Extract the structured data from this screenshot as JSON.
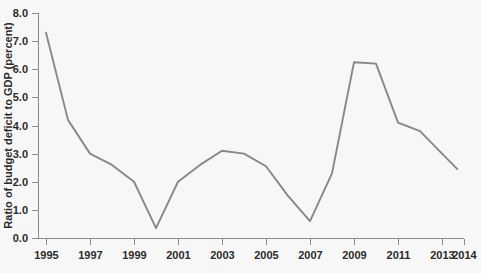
{
  "chart_data": {
    "type": "line",
    "title": "",
    "subtitle": "",
    "xlabel": "",
    "ylabel": "Ratio of budget deficit to GDP (percent)",
    "xlim": [
      1995,
      2014
    ],
    "ylim": [
      0.0,
      8.0
    ],
    "grid": false,
    "legend": null,
    "legend_position": "none",
    "x_tick_labels": [
      "1995",
      "1997",
      "1999",
      "2001",
      "2003",
      "2005",
      "2007",
      "2009",
      "2011",
      "2013",
      "2014"
    ],
    "x_tick_values": [
      1995,
      1997,
      1999,
      2001,
      2003,
      2005,
      2007,
      2009,
      2011,
      2013,
      2014
    ],
    "y_tick_labels": [
      "0.0",
      "1.0",
      "2.0",
      "3.0",
      "4.0",
      "5.0",
      "6.0",
      "7.0",
      "8.0"
    ],
    "y_tick_values": [
      0.0,
      1.0,
      2.0,
      3.0,
      4.0,
      5.0,
      6.0,
      7.0,
      8.0
    ],
    "line_color": "#888888",
    "axis_color": "#8a8a8a",
    "background_color": "#f7f7f7",
    "x": [
      1995,
      1996,
      1997,
      1998,
      1999,
      2000,
      2001,
      2002,
      2003,
      2004,
      2005,
      2006,
      2007,
      2008,
      2009,
      2010,
      2011,
      2012,
      2013,
      2013.7
    ],
    "values": [
      7.3,
      4.2,
      3.0,
      2.6,
      2.0,
      0.35,
      2.0,
      2.6,
      3.1,
      3.0,
      2.55,
      1.5,
      0.6,
      2.3,
      6.25,
      6.2,
      4.1,
      3.8,
      3.0,
      2.45
    ],
    "series": [
      {
        "name": "Ratio of budget deficit to GDP (percent)",
        "values": [
          7.3,
          4.2,
          3.0,
          2.6,
          2.0,
          0.35,
          2.0,
          2.6,
          3.1,
          3.0,
          2.55,
          1.5,
          0.6,
          2.3,
          6.25,
          6.2,
          4.1,
          3.8,
          3.0,
          2.45
        ]
      }
    ],
    "annotations": []
  },
  "axes": {
    "y_axis_title": "Ratio of budget deficit to GDP (percent)"
  }
}
